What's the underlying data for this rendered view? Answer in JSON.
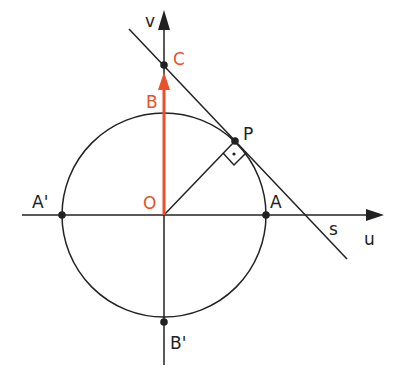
{
  "diagram": {
    "type": "unit-circle-tangent-construction",
    "colors": {
      "line": "#222222",
      "accent": "#e8512a",
      "background": "#ffffff"
    },
    "axes": {
      "horizontal": {
        "label": "u"
      },
      "vertical": {
        "label": "v"
      }
    },
    "points": {
      "O": {
        "label": "O",
        "color": "accent"
      },
      "A": {
        "label": "A"
      },
      "A_prime": {
        "label": "A'"
      },
      "B": {
        "label": "B",
        "color": "accent"
      },
      "B_prime": {
        "label": "B'"
      },
      "C": {
        "label": "C",
        "color": "accent"
      },
      "P": {
        "label": "P"
      }
    },
    "lines": {
      "tangent": {
        "label": "s"
      }
    },
    "annotations": {
      "right_angle_at": "P",
      "vector": "OB (orange arrow from O toward C)"
    }
  }
}
